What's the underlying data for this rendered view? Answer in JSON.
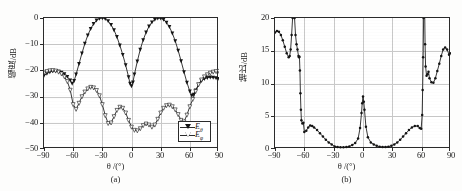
{
  "figure": {
    "background_color": "#fdfdfc",
    "axis_color": "#2b2b2b",
    "grid_color": "#c9c9c9",
    "curve_color": "#141414"
  },
  "panel_a": {
    "caption": "(a)",
    "xlabel": "θ /(°)",
    "ylabel": "幅度/dB",
    "xticks": [
      "−90",
      "−60",
      "−30",
      "0",
      "30",
      "60",
      "90"
    ],
    "yticks": [
      "0",
      "−10",
      "−20",
      "−30",
      "−40",
      "−50"
    ],
    "legend": [
      {
        "label": "E",
        "sub": "θ",
        "marker": "filled-triangle-down"
      },
      {
        "label": "E",
        "sub": "φ",
        "marker": "open-triangle-down"
      }
    ]
  },
  "panel_b": {
    "caption": "(b)",
    "xlabel": "θ /(°)",
    "ylabel": "轴比/dB",
    "xticks": [
      "−90",
      "−60",
      "−30",
      "0",
      "30",
      "60",
      "90"
    ],
    "yticks": [
      "0",
      "5",
      "10",
      "15",
      "20"
    ]
  },
  "chart_data": [
    {
      "type": "line",
      "id": "panel-a",
      "title": "",
      "xlabel": "θ /(°)",
      "ylabel": "幅度/dB",
      "xlim": [
        -90,
        90
      ],
      "ylim": [
        -50,
        0
      ],
      "xticks": [
        -90,
        -60,
        -30,
        0,
        30,
        60,
        90
      ],
      "yticks": [
        -50,
        -40,
        -30,
        -20,
        -10,
        0
      ],
      "grid": true,
      "legend_position": "lower-right",
      "series": [
        {
          "name": "E_theta",
          "marker": "filled-triangle-down",
          "x": [
            -90,
            -87,
            -84,
            -81,
            -78,
            -75,
            -72,
            -69,
            -66,
            -63,
            -61,
            -59,
            -57,
            -54,
            -51,
            -48,
            -45,
            -42,
            -39,
            -36,
            -33,
            -30,
            -27,
            -24,
            -21,
            -18,
            -15,
            -12,
            -9,
            -6,
            -3,
            -1.5,
            0,
            1.5,
            3,
            6,
            9,
            12,
            15,
            18,
            21,
            24,
            27,
            30,
            33,
            36,
            39,
            42,
            45,
            48,
            51,
            54,
            57,
            60,
            62,
            64,
            66,
            69,
            72,
            75,
            78,
            81,
            84,
            87,
            90
          ],
          "y": [
            -22.0,
            -21.2,
            -20.6,
            -20.3,
            -20.2,
            -20.4,
            -20.8,
            -21.4,
            -22.4,
            -23.8,
            -25.0,
            -24.0,
            -21.5,
            -17.5,
            -13.5,
            -9.8,
            -6.6,
            -4.1,
            -2.2,
            -0.9,
            -0.2,
            0.0,
            -0.3,
            -1.2,
            -2.6,
            -4.6,
            -7.2,
            -10.4,
            -14.0,
            -18.0,
            -22.5,
            -25.0,
            -26.0,
            -24.5,
            -21.5,
            -16.5,
            -12.0,
            -8.4,
            -5.5,
            -3.2,
            -1.6,
            -0.6,
            -0.1,
            -0.1,
            -0.6,
            -1.7,
            -3.4,
            -5.8,
            -8.8,
            -12.4,
            -16.4,
            -20.6,
            -24.6,
            -28.0,
            -29.6,
            -29.2,
            -27.6,
            -25.4,
            -24.0,
            -23.2,
            -22.8,
            -22.6,
            -22.7,
            -22.9,
            -23.2
          ]
        },
        {
          "name": "E_phi",
          "marker": "open-triangle-down",
          "x": [
            -90,
            -87,
            -84,
            -81,
            -78,
            -75,
            -72,
            -69,
            -66,
            -63,
            -60,
            -57,
            -54,
            -51,
            -48,
            -45,
            -42,
            -39,
            -36,
            -33,
            -30,
            -27,
            -24,
            -21,
            -18,
            -15,
            -12,
            -9,
            -6,
            -3,
            0,
            3,
            6,
            9,
            12,
            15,
            18,
            21,
            24,
            27,
            30,
            33,
            36,
            39,
            42,
            45,
            48,
            51,
            54,
            57,
            60,
            63,
            66,
            69,
            72,
            75,
            78,
            81,
            84,
            87,
            90
          ],
          "y": [
            -21.0,
            -20.4,
            -20.1,
            -20.0,
            -20.2,
            -20.6,
            -21.3,
            -22.4,
            -24.2,
            -27.5,
            -33.0,
            -34.8,
            -32.5,
            -30.0,
            -28.2,
            -27.0,
            -26.4,
            -26.6,
            -27.6,
            -29.6,
            -33.0,
            -37.2,
            -40.2,
            -40.0,
            -37.6,
            -35.2,
            -34.0,
            -34.4,
            -36.2,
            -39.0,
            -41.6,
            -42.8,
            -43.0,
            -42.2,
            -41.0,
            -40.4,
            -40.8,
            -41.6,
            -40.8,
            -38.6,
            -36.2,
            -34.4,
            -33.4,
            -33.2,
            -33.8,
            -35.0,
            -36.8,
            -39.0,
            -39.6,
            -37.0,
            -33.8,
            -31.0,
            -28.0,
            -25.4,
            -23.6,
            -22.4,
            -21.6,
            -21.0,
            -20.6,
            -20.4,
            -20.3
          ]
        }
      ]
    },
    {
      "type": "line",
      "id": "panel-b",
      "title": "",
      "xlabel": "θ /(°)",
      "ylabel": "轴比/dB",
      "xlim": [
        -90,
        90
      ],
      "ylim": [
        0,
        20
      ],
      "xticks": [
        -90,
        -60,
        -30,
        0,
        30,
        60,
        90
      ],
      "yticks": [
        0,
        5,
        10,
        15,
        20
      ],
      "grid": true,
      "legend_position": "none",
      "series": [
        {
          "name": "axial_ratio",
          "marker": "filled-circle",
          "x": [
            -90,
            -88,
            -86,
            -84,
            -82,
            -80,
            -78,
            -76,
            -75,
            -74,
            -73,
            -72,
            -71.5,
            -71,
            -70.5,
            -70,
            -69,
            -68,
            -67,
            -66,
            -65.5,
            -65,
            -64.5,
            -64,
            -63.5,
            -63,
            -62,
            -61,
            -60,
            -58,
            -56,
            -54,
            -52,
            -50,
            -47,
            -44,
            -41,
            -38,
            -35,
            -32,
            -29,
            -26,
            -23,
            -20,
            -17,
            -14,
            -11,
            -8,
            -5,
            -3,
            -1.5,
            -0.8,
            0,
            0.8,
            1.5,
            3,
            5,
            8,
            11,
            14,
            17,
            20,
            23,
            26,
            29,
            32,
            35,
            38,
            41,
            44,
            47,
            50,
            53,
            56,
            58,
            59.5,
            60.5,
            61,
            61.5,
            62,
            62.5,
            63,
            63.5,
            64,
            65,
            66,
            67,
            68,
            70,
            72,
            74,
            76,
            78,
            80,
            82,
            84,
            86,
            88,
            90
          ],
          "y": [
            17.8,
            18.0,
            17.9,
            17.4,
            16.6,
            15.6,
            14.6,
            14.0,
            14.2,
            15.2,
            17.4,
            20.0,
            24.0,
            28.0,
            24.0,
            20.0,
            17.4,
            16.0,
            15.2,
            14.2,
            14.0,
            14.1,
            12.0,
            8.5,
            6.0,
            4.4,
            3.9,
            4.0,
            2.6,
            2.8,
            3.3,
            3.6,
            3.5,
            3.3,
            2.9,
            2.4,
            1.9,
            1.4,
            1.0,
            0.7,
            0.4,
            0.3,
            0.25,
            0.25,
            0.3,
            0.4,
            0.6,
            0.9,
            1.6,
            3.2,
            5.5,
            7.0,
            8.0,
            7.2,
            6.0,
            3.4,
            1.8,
            1.0,
            0.7,
            0.5,
            0.35,
            0.3,
            0.3,
            0.35,
            0.5,
            0.7,
            1.0,
            1.4,
            1.9,
            2.4,
            2.9,
            3.3,
            3.5,
            3.5,
            3.2,
            3.1,
            5.2,
            9.0,
            14.0,
            20.0,
            26.0,
            22.0,
            16.0,
            12.6,
            11.2,
            11.4,
            11.8,
            10.8,
            10.2,
            10.1,
            10.8,
            11.9,
            13.0,
            14.2,
            15.2,
            15.5,
            15.2,
            14.4,
            14.6,
            15.2
          ]
        }
      ]
    }
  ]
}
